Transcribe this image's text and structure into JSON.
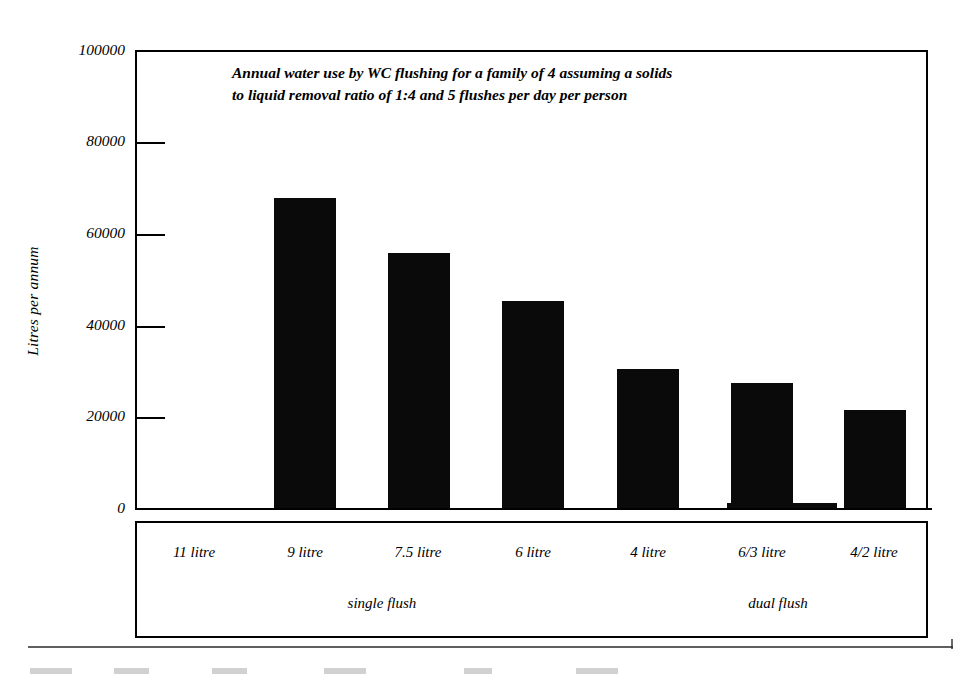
{
  "chart_data": {
    "type": "bar",
    "title": "Annual water use by WC flushing for a family of 4 assuming a solids to liquid removal ratio of 1:4 and 5 flushes per day per person",
    "title_line1": "Annual water use by WC flushing for a family of 4 assuming a solids",
    "title_line2": "to liquid removal ratio of 1:4 and 5 flushes per day per person",
    "xlabel": "",
    "ylabel": "Litres per annum",
    "ylim": [
      0,
      100000
    ],
    "ytick_labels": [
      "100000",
      "80000",
      "60000",
      "40000",
      "20000",
      "0"
    ],
    "ytick_values": [
      100000,
      80000,
      60000,
      40000,
      20000,
      0
    ],
    "grid": false,
    "legend": "none",
    "bar_color": "#0a0a0a",
    "categories": [
      "11 litre",
      "9 litre",
      "7.5 litre",
      "6 litre",
      "4 litre",
      "6/3 litre",
      "4/2 litre"
    ],
    "values": [
      null,
      67700,
      55700,
      45200,
      30400,
      27300,
      21400
    ],
    "groups": [
      {
        "label": "single flush",
        "categories": [
          "11 litre",
          "9 litre",
          "7.5 litre",
          "6 litre",
          "4 litre"
        ]
      },
      {
        "label": "dual flush",
        "categories": [
          "6/3 litre",
          "4/2 litre"
        ]
      }
    ],
    "group_labels": [
      "single flush",
      "dual flush"
    ]
  },
  "axes": {
    "y_title": "Litres per annum",
    "ticks": [
      {
        "label": "100000",
        "value": 100000
      },
      {
        "label": "80000",
        "value": 80000
      },
      {
        "label": "60000",
        "value": 60000
      },
      {
        "label": "40000",
        "value": 40000
      },
      {
        "label": "20000",
        "value": 20000
      },
      {
        "label": "0",
        "value": 0
      }
    ]
  },
  "bars": [
    {
      "category": "11 litre",
      "value": null
    },
    {
      "category": "9 litre",
      "value": 67700
    },
    {
      "category": "7.5 litre",
      "value": 55700
    },
    {
      "category": "6 litre",
      "value": 45200
    },
    {
      "category": "4 litre",
      "value": 30400
    },
    {
      "category": "6/3 litre",
      "value": 27300
    },
    {
      "category": "4/2 litre",
      "value": 21400
    }
  ]
}
